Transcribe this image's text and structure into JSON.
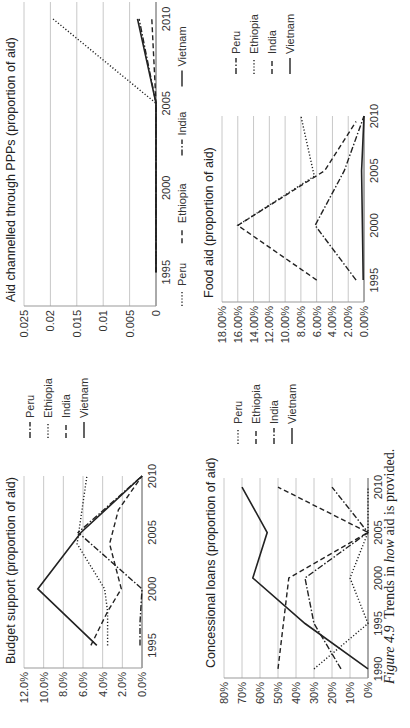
{
  "caption": {
    "label": "Figure 4.9",
    "text_pre": "Trends in ",
    "text_em": "how",
    "text_post": " aid is provided."
  },
  "styles": {
    "solid": "",
    "dotted": "1.2,2",
    "dashed": "5,3",
    "dashdot": "6,2,1.5,2"
  },
  "chart_data": [
    {
      "id": "budget",
      "type": "line",
      "title": "Budget support (proportion of aid)",
      "xlabel": "",
      "ylabel": "",
      "x": [
        1995,
        2000,
        2005,
        2010
      ],
      "yticks": [
        "0.0%",
        "2.0%",
        "4.0%",
        "6.0%",
        "8.0%",
        "10.0%",
        "12.0%"
      ],
      "ylim": [
        0,
        12
      ],
      "legend_position": "right",
      "series": [
        {
          "name": "Peru",
          "style": "dashdot",
          "points": [
            [
              1995,
              0.2
            ],
            [
              1997,
              0.2
            ],
            [
              2000,
              0.0
            ],
            [
              2005,
              6.5
            ],
            [
              2010,
              0.0
            ]
          ]
        },
        {
          "name": "Ethiopia",
          "style": "dotted",
          "points": [
            [
              1995,
              3.5
            ],
            [
              1998,
              3.5
            ],
            [
              2000,
              3.8
            ],
            [
              2004,
              6.6
            ],
            [
              2010,
              5.6
            ]
          ]
        },
        {
          "name": "India",
          "style": "dashed",
          "points": [
            [
              1995,
              5.2
            ],
            [
              1998,
              3.5
            ],
            [
              2000,
              2.1
            ],
            [
              2004,
              3.3
            ],
            [
              2007,
              2.4
            ],
            [
              2010,
              0.0
            ]
          ]
        },
        {
          "name": "Vietnam",
          "style": "solid",
          "points": [
            [
              1995,
              4.6
            ],
            [
              2000,
              10.6
            ],
            [
              2005,
              6.2
            ],
            [
              2010,
              0.0
            ]
          ]
        }
      ]
    },
    {
      "id": "ppp",
      "type": "line",
      "title": "Aid channelled through PPPs (proportion of aid)",
      "xlabel": "",
      "ylabel": "",
      "x": [
        1995,
        2000,
        2005,
        2010
      ],
      "yticks": [
        "0",
        "0.005",
        "0.01",
        "0.015",
        "0.02",
        "0.025"
      ],
      "ylim": [
        0,
        0.025
      ],
      "legend_position": "bottom",
      "series": [
        {
          "name": "Peru",
          "style": "dotted",
          "points": [
            [
              1995,
              0
            ],
            [
              2005,
              0
            ],
            [
              2010,
              0.0195
            ]
          ]
        },
        {
          "name": "Ethiopia",
          "style": "dashed",
          "points": [
            [
              1995,
              0
            ],
            [
              2005,
              0
            ],
            [
              2010,
              0.0008
            ]
          ]
        },
        {
          "name": "India",
          "style": "dashdot",
          "points": [
            [
              1995,
              0
            ],
            [
              2005,
              0
            ],
            [
              2010,
              0.0032
            ]
          ]
        },
        {
          "name": "Vietnam",
          "style": "solid",
          "points": [
            [
              1995,
              0
            ],
            [
              2005,
              0
            ],
            [
              2010,
              0.0035
            ]
          ]
        }
      ]
    },
    {
      "id": "loans",
      "type": "line",
      "title": "Concessional loans (proportion of aid)",
      "xlabel": "",
      "ylabel": "",
      "x": [
        1990,
        1995,
        2000,
        2005,
        2010
      ],
      "yticks": [
        "0%",
        "10%",
        "20%",
        "30%",
        "40%",
        "50%",
        "60%",
        "70%",
        "80%"
      ],
      "ylim": [
        0,
        80
      ],
      "legend_position": "right",
      "series": [
        {
          "name": "Peru",
          "style": "dotted",
          "points": [
            [
              1990,
              30
            ],
            [
              1995,
              0
            ],
            [
              2000,
              10
            ],
            [
              2005,
              0
            ],
            [
              2010,
              0
            ]
          ]
        },
        {
          "name": "Ethiopia",
          "style": "dashed",
          "points": [
            [
              1990,
              50
            ],
            [
              2000,
              44
            ],
            [
              2005,
              0
            ],
            [
              2010,
              50
            ]
          ]
        },
        {
          "name": "India",
          "style": "dashdot",
          "points": [
            [
              1990,
              15
            ],
            [
              1995,
              30
            ],
            [
              2000,
              35
            ],
            [
              2005,
              0
            ],
            [
              2010,
              20
            ]
          ]
        },
        {
          "name": "Vietnam",
          "style": "solid",
          "points": [
            [
              1990,
              0
            ],
            [
              1995,
              35
            ],
            [
              2000,
              64
            ],
            [
              2005,
              56
            ],
            [
              2010,
              70
            ]
          ]
        }
      ]
    },
    {
      "id": "food",
      "type": "line",
      "title": "Food aid (proportion of aid)",
      "xlabel": "",
      "ylabel": "",
      "x": [
        1995,
        2000,
        2005,
        2010
      ],
      "yticks": [
        "0.00%",
        "2.00%",
        "4.00%",
        "6.00%",
        "8.00%",
        "10.00%",
        "12.00%",
        "14.00%",
        "16.00%",
        "18.00%"
      ],
      "ylim": [
        0,
        18
      ],
      "legend_position": "right",
      "series": [
        {
          "name": "Peru",
          "style": "dashdot",
          "points": [
            [
              1995,
              1.0
            ],
            [
              2000,
              6.2
            ],
            [
              2005,
              2.5
            ],
            [
              2010,
              0.0
            ]
          ]
        },
        {
          "name": "Ethiopia",
          "style": "dotted",
          "points": [
            [
              2000,
              16.0
            ],
            [
              2004.5,
              6.3
            ],
            [
              2010,
              8.0
            ]
          ]
        },
        {
          "name": "India",
          "style": "dashed",
          "points": [
            [
              1995,
              6.0
            ],
            [
              2000,
              16.0
            ],
            [
              2005,
              5.0
            ],
            [
              2009.5,
              1.0
            ]
          ]
        },
        {
          "name": "Vietnam",
          "style": "solid",
          "points": [
            [
              1995,
              0.1
            ],
            [
              2005,
              0.3
            ],
            [
              2010,
              0.0
            ]
          ]
        }
      ]
    }
  ],
  "panels": {
    "budget": {
      "left": 0,
      "top": 0,
      "plot": [
        60,
        24,
        192,
        118
      ],
      "xrange": [
        1993,
        2010
      ],
      "legend": [
        290,
        30,
        18
      ]
    },
    "ppp": {
      "left": 364,
      "top": 0,
      "plot": [
        58,
        24,
        304,
        132
      ],
      "xrange": [
        1993,
        2011
      ],
      "legend_bottom": [
        58,
        182
      ]
    },
    "loans": {
      "left": 0,
      "top": 200,
      "plot": [
        50,
        24,
        200,
        144
      ],
      "xrange": [
        1989,
        2011
      ],
      "legend": [
        284,
        38,
        18
      ]
    },
    "food": {
      "left": 364,
      "top": 200,
      "plot": [
        62,
        22,
        186,
        142
      ],
      "xrange": [
        1993,
        2010
      ],
      "legend": [
        290,
        36,
        18
      ]
    }
  }
}
